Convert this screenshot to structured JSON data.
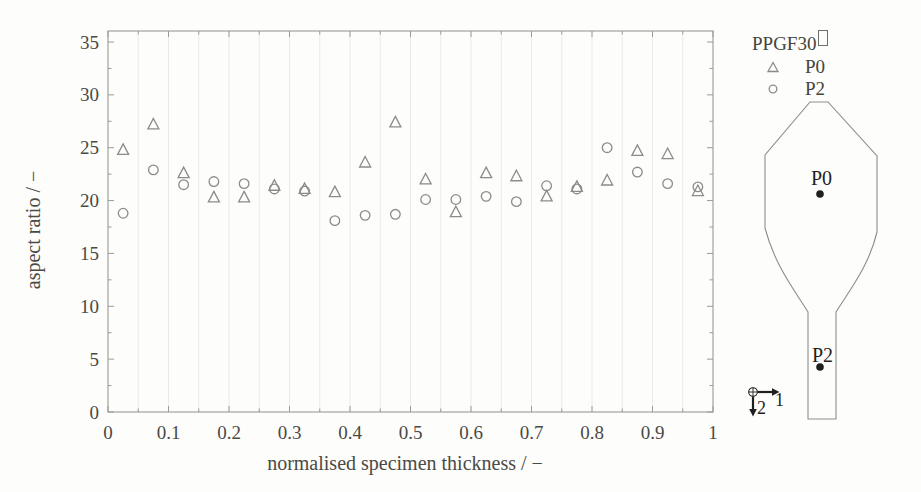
{
  "chart_data": {
    "type": "scatter",
    "title": "",
    "xlabel": "normalised specimen thickness / −",
    "ylabel": "aspect ratio / −",
    "xlim": [
      0,
      1
    ],
    "ylim": [
      0,
      35
    ],
    "x_ticks": [
      "0",
      "0.1",
      "0.2",
      "0.3",
      "0.4",
      "0.5",
      "0.6",
      "0.7",
      "0.8",
      "0.9",
      "1"
    ],
    "y_ticks": [
      "0",
      "5",
      "10",
      "15",
      "20",
      "25",
      "30",
      "35"
    ],
    "grid": "faint vertical gridlines every 0.05, no horizontal gridlines",
    "legend": {
      "title": "PPGF30",
      "position": "outside-top-right",
      "entries": [
        {
          "label": "P0",
          "marker": "triangle"
        },
        {
          "label": "P2",
          "marker": "circle"
        }
      ]
    },
    "series": [
      {
        "name": "P0",
        "marker": "triangle",
        "x": [
          0.025,
          0.075,
          0.125,
          0.175,
          0.225,
          0.275,
          0.325,
          0.375,
          0.425,
          0.475,
          0.525,
          0.575,
          0.625,
          0.675,
          0.725,
          0.775,
          0.825,
          0.875,
          0.925,
          0.975
        ],
        "y": [
          24.8,
          27.2,
          22.6,
          20.3,
          20.3,
          21.4,
          21.1,
          20.8,
          23.6,
          27.4,
          22.0,
          18.9,
          22.6,
          22.3,
          20.4,
          21.3,
          21.9,
          24.7,
          24.4,
          20.9
        ]
      },
      {
        "name": "P2",
        "marker": "circle",
        "x": [
          0.025,
          0.075,
          0.125,
          0.175,
          0.225,
          0.275,
          0.325,
          0.375,
          0.425,
          0.475,
          0.525,
          0.575,
          0.625,
          0.675,
          0.725,
          0.775,
          0.825,
          0.875,
          0.925,
          0.975
        ],
        "y": [
          18.8,
          22.9,
          21.5,
          21.8,
          21.6,
          21.1,
          20.9,
          18.1,
          18.6,
          18.7,
          20.1,
          20.1,
          20.4,
          19.9,
          21.4,
          21.1,
          25.0,
          22.7,
          21.6,
          21.3
        ]
      }
    ]
  },
  "diagram": {
    "p0_label": "P0",
    "p2_label": "P2",
    "axis1_label": "1",
    "axis2_label": "2"
  },
  "colors": {
    "marker": "#8b8b87",
    "frame": "#9a9a96",
    "grid": "#ebe9e3",
    "text": "#4a4a46",
    "ink": "#1f1f1f"
  }
}
